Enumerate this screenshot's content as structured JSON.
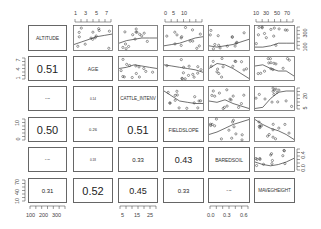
{
  "chart_data": {
    "type": "scatter",
    "title": "",
    "layout": "pairs-matrix",
    "variables": [
      "ALTITUDE",
      "AGE",
      "CATTLE_INTENV",
      "FIELDSLOPE",
      "BAREDSOIL",
      "MAVEGHEIGHT"
    ],
    "lower_panel_correlations": [
      {
        "row": 2,
        "col": 1,
        "value": "0.51",
        "size": "large"
      },
      {
        "row": 3,
        "col": 1,
        "value": "0.11",
        "size": "tiny"
      },
      {
        "row": 3,
        "col": 2,
        "value": "0.14",
        "size": "tiny"
      },
      {
        "row": 4,
        "col": 1,
        "value": "0.50",
        "size": "large"
      },
      {
        "row": 4,
        "col": 2,
        "value": "0.26",
        "size": "tiny"
      },
      {
        "row": 4,
        "col": 3,
        "value": "0.51",
        "size": "large"
      },
      {
        "row": 5,
        "col": 1,
        "value": "0.10",
        "size": "tiny"
      },
      {
        "row": 5,
        "col": 2,
        "value": "0.18",
        "size": "tiny"
      },
      {
        "row": 5,
        "col": 3,
        "value": "0.33",
        "size": "small"
      },
      {
        "row": 5,
        "col": 4,
        "value": "0.43",
        "size": "medium"
      },
      {
        "row": 6,
        "col": 1,
        "value": "0.31",
        "size": "small"
      },
      {
        "row": 6,
        "col": 2,
        "value": "0.52",
        "size": "large"
      },
      {
        "row": 6,
        "col": 3,
        "value": "0.45",
        "size": "medium"
      },
      {
        "row": 6,
        "col": 4,
        "value": "0.33",
        "size": "small"
      },
      {
        "row": 6,
        "col": 5,
        "value": "0.05",
        "size": "tiny"
      }
    ],
    "axes": {
      "top": [
        {
          "col": 2,
          "ticks": [
            "1",
            "3",
            "5",
            "7"
          ]
        },
        {
          "col": 4,
          "ticks": [
            "0",
            "5",
            "10"
          ]
        },
        {
          "col": 6,
          "ticks": [
            "10",
            "30",
            "50",
            "70"
          ]
        }
      ],
      "bottom": [
        {
          "col": 1,
          "ticks": [
            "100",
            "200",
            "300"
          ]
        },
        {
          "col": 3,
          "ticks": [
            "5",
            "15",
            "25"
          ]
        },
        {
          "col": 5,
          "ticks": [
            "0.0",
            "0.3",
            "0.6"
          ]
        }
      ],
      "left": [
        {
          "row": 2,
          "ticks": [
            "1",
            "4",
            "7"
          ]
        },
        {
          "row": 4,
          "ticks": [
            "0",
            "10"
          ]
        },
        {
          "row": 6,
          "ticks": [
            "10",
            "40",
            "70"
          ]
        }
      ],
      "right": [
        {
          "row": 1,
          "ticks": [
            "100",
            "300"
          ]
        },
        {
          "row": 3,
          "ticks": [
            "5",
            "20"
          ]
        },
        {
          "row": 5,
          "ticks": [
            "0.0",
            "0.4"
          ]
        }
      ]
    },
    "upper_panels": "scatter with lowess smoother",
    "grid": false,
    "legend": "none"
  },
  "labels": {
    "v1": "ALTITUDE",
    "v2": "AGE",
    "v3": "CATTLE_INTENV",
    "v4": "FIELDSLOPE",
    "v5": "BAREDSOIL",
    "v6": "MAVEGHEIGHT"
  },
  "cors": {
    "r2c1": "0.51",
    "r3c1": "0.11",
    "r3c2": "0.14",
    "r4c1": "0.50",
    "r4c2": "0.26",
    "r4c3": "0.51",
    "r5c1": "0.10",
    "r5c2": "0.18",
    "r5c3": "0.33",
    "r5c4": "0.43",
    "r6c1": "0.31",
    "r6c2": "0.52",
    "r6c3": "0.45",
    "r6c4": "0.33",
    "r6c5": "0.05"
  },
  "ticks": {
    "top2": [
      "1",
      "3",
      "5",
      "7"
    ],
    "top4": [
      "0",
      "5",
      "10"
    ],
    "top6": [
      "10",
      "30",
      "50",
      "70"
    ],
    "bot1": [
      "100",
      "200",
      "300"
    ],
    "bot3": [
      "5",
      "15",
      "25"
    ],
    "bot5": [
      "0.0",
      "0.3",
      "0.6"
    ],
    "left2": [
      "1",
      "4",
      "7"
    ],
    "left4": [
      "0",
      "10"
    ],
    "left6": [
      "10",
      "40",
      "70"
    ],
    "right1": [
      "100",
      "300"
    ],
    "right3": [
      "5",
      "20"
    ],
    "right5": [
      "0.0",
      "0.4"
    ]
  }
}
